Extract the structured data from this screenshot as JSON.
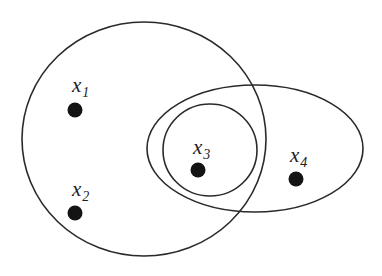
{
  "diagram": {
    "type": "set-diagram",
    "background": "#ffffff",
    "stroke_color": "#2a2a2a",
    "dot_color": "#141414",
    "sets": [
      {
        "id": "large-circle",
        "cx": 144,
        "cy": 139,
        "rx": 122,
        "ry": 117
      },
      {
        "id": "right-ellipse",
        "cx": 255,
        "cy": 148.5,
        "rx": 108,
        "ry": 63.5
      },
      {
        "id": "inner-circle",
        "cx": 210,
        "cy": 150,
        "rx": 47,
        "ry": 46
      }
    ],
    "nodes": [
      {
        "id": "x1",
        "base": "x",
        "sub": "1",
        "cx": 75,
        "cy": 110,
        "r": 7.5,
        "label_x": 72,
        "label_y": 92
      },
      {
        "id": "x2",
        "base": "x",
        "sub": "2",
        "cx": 75,
        "cy": 213,
        "r": 7.5,
        "label_x": 72,
        "label_y": 196
      },
      {
        "id": "x3",
        "base": "x",
        "sub": "3",
        "cx": 198,
        "cy": 170,
        "r": 7.5,
        "label_x": 193,
        "label_y": 154
      },
      {
        "id": "x4",
        "base": "x",
        "sub": "4",
        "cx": 296,
        "cy": 179,
        "r": 7.5,
        "label_x": 290,
        "label_y": 162
      }
    ]
  }
}
